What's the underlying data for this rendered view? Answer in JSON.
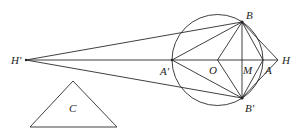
{
  "figure": {
    "points": {
      "H_prime": {
        "label": "H'",
        "x": 26,
        "y": 60
      },
      "A_prime": {
        "label": "A'",
        "x": 172,
        "y": 60
      },
      "O": {
        "label": "O",
        "x": 217,
        "y": 60
      },
      "M": {
        "label": "M",
        "x": 242,
        "y": 60
      },
      "A": {
        "label": "A",
        "x": 263,
        "y": 60
      },
      "H": {
        "label": "H",
        "x": 278,
        "y": 60
      },
      "B": {
        "label": "B",
        "x": 242,
        "y": 22
      },
      "B_prime": {
        "label": "B'",
        "x": 242,
        "y": 98
      }
    },
    "circle": {
      "center": "O",
      "radius": 45.5
    },
    "triangle": {
      "label": "C",
      "apex": [
        73,
        81
      ],
      "base_left": [
        30,
        127
      ],
      "base_right": [
        117,
        127
      ]
    },
    "labels": {
      "H_prime": "H'",
      "A_prime": "A'",
      "O": "O",
      "M": "M",
      "A": "A",
      "H": "H",
      "B": "B",
      "B_prime": "B'",
      "C": "C"
    }
  }
}
